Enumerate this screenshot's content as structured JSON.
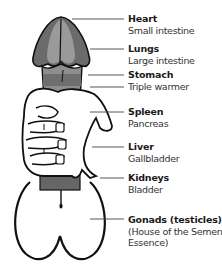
{
  "diagram": {
    "labels": [
      {
        "organ": "Heart",
        "paired": "Small intestine",
        "top": 14
      },
      {
        "organ": "Lungs",
        "paired": "Large intestine",
        "top": 44
      },
      {
        "organ": "Stomach",
        "paired": "Triple warmer",
        "top": 70
      },
      {
        "organ": "Spleen",
        "paired": "Pancreas",
        "top": 107
      },
      {
        "organ": "Liver",
        "paired": "Gallbladder",
        "top": 142
      },
      {
        "organ": "Kidneys",
        "paired": "Bladder",
        "top": 173
      },
      {
        "organ": "Gonads (testicles)",
        "paired": "(House of the Semen",
        "paired2": "Essence)",
        "top": 215
      }
    ],
    "colors": {
      "dark_zone": "#6b6b6b",
      "mid_zone": "#8e8e8e",
      "light_zone": "#a8a8a8",
      "outline": "#111111",
      "leader": "#444444"
    }
  }
}
